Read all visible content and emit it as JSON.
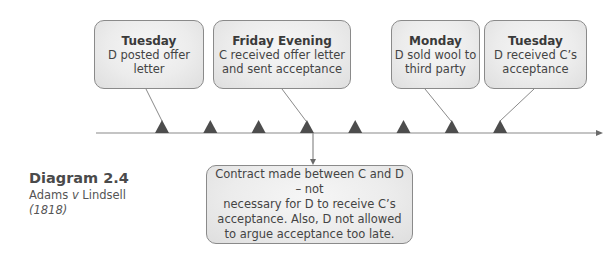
{
  "events": [
    {
      "title": "Tuesday",
      "description": "D posted offer\nletter"
    },
    {
      "title": "Friday Evening",
      "description": "C received offer letter\nand sent acceptance"
    },
    {
      "title": "Monday",
      "description": "D sold wool to\nthird party"
    },
    {
      "title": "Tuesday",
      "description": "D received C’s\nacceptance"
    }
  ],
  "timeline": {
    "marker_count": 8,
    "event_marker_indices": [
      0,
      3,
      6,
      7
    ],
    "result_marker_index": 3
  },
  "result": {
    "text": "Contract made between C and D – not\nnecessary for D to receive C’s\nacceptance.  Also, D not allowed\nto argue acceptance too late."
  },
  "caption": {
    "heading": "Diagram 2.4",
    "case_name_a": "Adams ",
    "case_name_v": "v",
    "case_name_b": " Lindsell",
    "year": "(1818)"
  },
  "colors": {
    "line": "#8a8a8a",
    "marker": "#4d4d4d",
    "box_border": "#8a8a8a"
  }
}
